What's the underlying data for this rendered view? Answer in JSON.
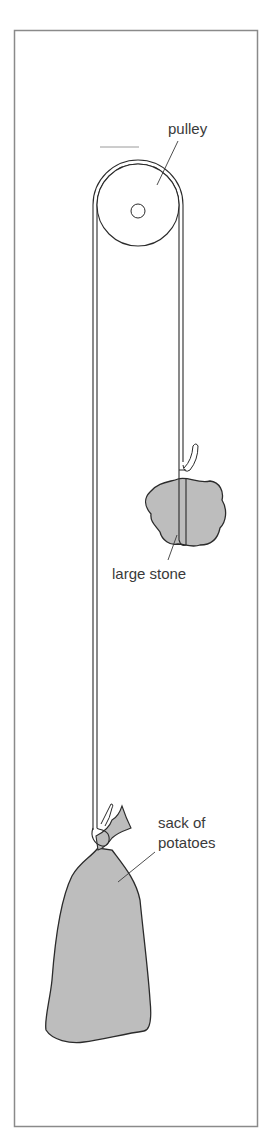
{
  "diagram": {
    "labels": {
      "pulley": "pulley",
      "stone": "large stone",
      "sack_line1": "sack of",
      "sack_line2": "potatoes"
    },
    "colors": {
      "frame": "#8a8a8a",
      "outline": "#2b2b2b",
      "fill": "#bdbdbd",
      "text": "#3a3a3a",
      "background": "#ffffff"
    }
  }
}
